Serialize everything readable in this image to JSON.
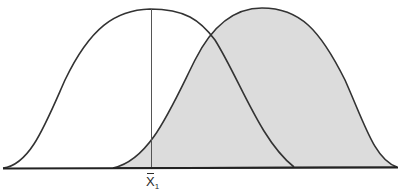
{
  "figure": {
    "type": "overlapping-distributions",
    "curves": [
      {
        "name": "distribution-1",
        "fill": "#ffffff",
        "stroke": "#333333",
        "peak_x": 150,
        "base_left_x": 3,
        "base_right_x": 294
      },
      {
        "name": "distribution-2",
        "fill": "#dcdcdc",
        "stroke": "#333333",
        "peak_x": 262,
        "base_left_x": 113,
        "base_right_x": 397
      }
    ],
    "marker": {
      "label_symbol": "X",
      "label_subscript": "1",
      "x": 151
    },
    "colors": {
      "shade": "#dcdcdc",
      "stroke": "#333333",
      "background": "#ffffff"
    }
  }
}
